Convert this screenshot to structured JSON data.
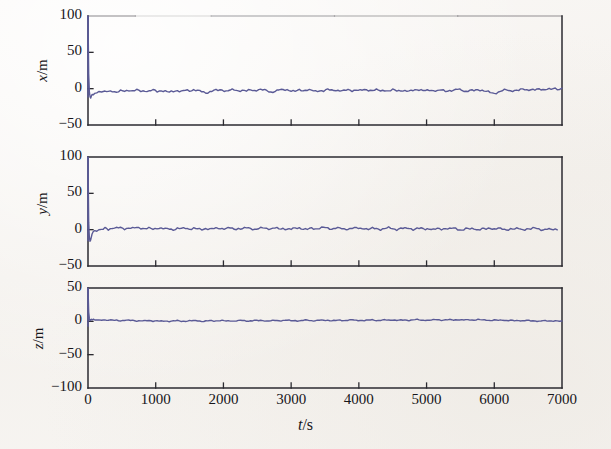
{
  "figure": {
    "background_color": "#f6f4f1",
    "axis_color": "#2b2a30",
    "trace_color": "#5a5a96",
    "xlabel": "t/s",
    "xlabel_var": "t",
    "xlabel_unit": "/s"
  },
  "chart_data": [
    {
      "type": "line",
      "title": "",
      "panel_id": "panel-x",
      "xlabel": "t/s",
      "ylabel": "x/m",
      "ylabel_var": "x",
      "ylabel_unit": "/m",
      "xlim": [
        0,
        7000
      ],
      "ylim": [
        -50,
        100
      ],
      "xticks": [
        0,
        1000,
        2000,
        3000,
        4000,
        5000,
        6000,
        7000
      ],
      "xtick_labels": [
        "0",
        "1000",
        "2000",
        "3000",
        "4000",
        "5000",
        "6000",
        "7000"
      ],
      "xtick_labels_visible": false,
      "yticks": [
        -50,
        0,
        50,
        100
      ],
      "ytick_labels": [
        "-50",
        "0",
        "50",
        "100"
      ],
      "grid": false,
      "legend": null,
      "series": [
        {
          "name": "x error",
          "color": "#5a5a96",
          "initial_transient": {
            "t": 0,
            "from": 100,
            "to": -12
          },
          "x": [
            0,
            10,
            20,
            30,
            40,
            50,
            60,
            80,
            100,
            130,
            160,
            200,
            250,
            300,
            360,
            420,
            480,
            540,
            600,
            660,
            720,
            780,
            840,
            900,
            960,
            1020,
            1080,
            1140,
            1200,
            1260,
            1320,
            1380,
            1440,
            1500,
            1560,
            1620,
            1680,
            1740,
            1800,
            1860,
            1920,
            1980,
            2040,
            2100,
            2160,
            2220,
            2280,
            2340,
            2400,
            2460,
            2520,
            2580,
            2640,
            2700,
            2760,
            2820,
            2880,
            2940,
            3000,
            3060,
            3120,
            3180,
            3240,
            3300,
            3360,
            3420,
            3480,
            3540,
            3600,
            3660,
            3720,
            3780,
            3840,
            3900,
            3960,
            4020,
            4080,
            4140,
            4200,
            4260,
            4320,
            4380,
            4440,
            4500,
            4560,
            4620,
            4680,
            4740,
            4800,
            4860,
            4920,
            4980,
            5040,
            5100,
            5160,
            5220,
            5280,
            5340,
            5400,
            5460,
            5520,
            5580,
            5640,
            5700,
            5760,
            5820,
            5880,
            5940,
            6000,
            6060,
            6120,
            6180,
            6240,
            6300,
            6360,
            6420,
            6480,
            6540,
            6600,
            6660,
            6720,
            6780,
            6840,
            6900,
            6960,
            7000
          ],
          "y": [
            100,
            20,
            -4,
            -11,
            -13,
            -10,
            -8,
            -9,
            -7,
            -6,
            -5,
            -4,
            -3.5,
            -4.2,
            -3.0,
            -4.6,
            -2.8,
            -3.6,
            -2.2,
            -3.4,
            -1.8,
            -3.0,
            -2.6,
            -4.0,
            -2.4,
            -3.8,
            -2.0,
            -3.2,
            -5.4,
            -4.0,
            -2.6,
            -3.4,
            -2.0,
            -3.0,
            -1.6,
            -2.8,
            -4.2,
            -5.6,
            -3.8,
            -2.4,
            -3.0,
            -1.8,
            -2.6,
            -1.4,
            -2.2,
            -3.6,
            -2.0,
            -3.0,
            -1.6,
            -2.6,
            -1.2,
            -2.0,
            -3.2,
            -4.4,
            -3.0,
            -1.8,
            -2.6,
            -1.4,
            -2.2,
            -3.4,
            -2.0,
            -2.8,
            -1.6,
            -2.4,
            -3.6,
            -2.2,
            -3.0,
            -1.8,
            -2.6,
            -1.4,
            -2.2,
            -3.2,
            -2.0,
            -2.8,
            -1.6,
            -2.4,
            -1.2,
            -2.0,
            -3.0,
            -1.8,
            -2.6,
            -1.4,
            -3.6,
            -2.2,
            -3.0,
            -1.8,
            -2.6,
            -4.0,
            -2.4,
            -1.2,
            -2.0,
            -2.8,
            -1.6,
            -2.4,
            -3.6,
            -2.2,
            -3.0,
            -1.8,
            -2.6,
            -1.4,
            -2.2,
            -3.4,
            -2.0,
            -2.8,
            -1.6,
            -2.4,
            -3.8,
            -5.0,
            -6.2,
            -4.6,
            -3.2,
            -2.0,
            -2.8,
            -1.6,
            -2.4,
            -1.2,
            -2.0,
            -0.8,
            -1.6,
            -0.6,
            -1.4,
            -0.4,
            -1.2,
            0.2,
            -0.6,
            0.8,
            0.4
          ]
        }
      ]
    },
    {
      "type": "line",
      "title": "",
      "panel_id": "panel-y",
      "xlabel": "t/s",
      "ylabel": "y/m",
      "ylabel_var": "y",
      "ylabel_unit": "/m",
      "xlim": [
        0,
        7000
      ],
      "ylim": [
        -50,
        100
      ],
      "xticks": [
        0,
        1000,
        2000,
        3000,
        4000,
        5000,
        6000,
        7000
      ],
      "xtick_labels": [
        "0",
        "1000",
        "2000",
        "3000",
        "4000",
        "5000",
        "6000",
        "7000"
      ],
      "xtick_labels_visible": false,
      "yticks": [
        -50,
        0,
        50,
        100
      ],
      "ytick_labels": [
        "-50",
        "0",
        "50",
        "100"
      ],
      "grid": false,
      "legend": null,
      "series": [
        {
          "name": "y error",
          "color": "#5a5a96",
          "initial_transient": {
            "t": 0,
            "from": 100,
            "to": -16
          },
          "x": [
            0,
            10,
            20,
            30,
            40,
            50,
            60,
            80,
            100,
            130,
            160,
            200,
            250,
            300,
            360,
            420,
            480,
            540,
            600,
            660,
            720,
            780,
            840,
            900,
            960,
            1020,
            1080,
            1140,
            1200,
            1260,
            1320,
            1380,
            1440,
            1500,
            1560,
            1620,
            1680,
            1740,
            1800,
            1860,
            1920,
            1980,
            2040,
            2100,
            2160,
            2220,
            2280,
            2340,
            2400,
            2460,
            2520,
            2580,
            2640,
            2700,
            2760,
            2820,
            2880,
            2940,
            3000,
            3060,
            3120,
            3180,
            3240,
            3300,
            3360,
            3420,
            3480,
            3540,
            3600,
            3660,
            3720,
            3780,
            3840,
            3900,
            3960,
            4020,
            4080,
            4140,
            4200,
            4260,
            4320,
            4380,
            4440,
            4500,
            4560,
            4620,
            4680,
            4740,
            4800,
            4860,
            4920,
            4980,
            5040,
            5100,
            5160,
            5220,
            5280,
            5340,
            5400,
            5460,
            5520,
            5580,
            5640,
            5700,
            5760,
            5820,
            5880,
            5940,
            6000,
            6060,
            6120,
            6180,
            6240,
            6300,
            6360,
            6420,
            6480,
            6540,
            6600,
            6660,
            6720,
            6780,
            6840,
            6900,
            6960,
            7000
          ],
          "y": [
            100,
            10,
            -10,
            -16,
            -14,
            -10,
            -6,
            -3,
            -1.5,
            -0.5,
            0.5,
            1.2,
            1.8,
            1.0,
            2.2,
            1.4,
            2.6,
            1.6,
            2.8,
            1.8,
            3.0,
            2.0,
            1.0,
            2.2,
            1.2,
            2.4,
            1.4,
            0.4,
            1.6,
            0.6,
            1.8,
            0.8,
            2.0,
            1.0,
            2.2,
            1.2,
            0.2,
            1.4,
            0.4,
            1.6,
            2.8,
            1.8,
            0.8,
            2.0,
            1.0,
            2.2,
            1.2,
            2.4,
            1.4,
            0.4,
            1.6,
            2.8,
            1.8,
            0.8,
            2.0,
            1.0,
            2.2,
            1.2,
            0.2,
            1.4,
            2.6,
            1.6,
            0.6,
            1.8,
            0.8,
            2.0,
            3.2,
            2.2,
            1.2,
            2.4,
            1.4,
            0.4,
            1.6,
            2.8,
            1.8,
            0.8,
            2.0,
            1.0,
            2.2,
            1.2,
            0.2,
            1.4,
            2.6,
            1.6,
            0.6,
            1.8,
            0.8,
            2.0,
            1.0,
            2.2,
            1.2,
            0.2,
            1.4,
            0.4,
            1.6,
            0.6,
            1.8,
            0.8,
            2.0,
            1.0,
            0.0,
            1.2,
            0.2,
            1.4,
            0.4,
            1.6,
            0.6,
            1.8,
            0.8,
            2.0,
            1.0,
            0.0,
            1.2,
            0.2,
            1.4,
            0.4,
            1.6,
            0.6,
            1.8,
            0.8,
            0.0,
            1.0,
            0.2,
            0.6,
            0.4
          ]
        }
      ]
    },
    {
      "type": "line",
      "title": "",
      "panel_id": "panel-z",
      "xlabel": "t/s",
      "ylabel": "z/m",
      "ylabel_var": "z",
      "ylabel_unit": "/m",
      "xlim": [
        0,
        7000
      ],
      "ylim": [
        -100,
        50
      ],
      "xticks": [
        0,
        1000,
        2000,
        3000,
        4000,
        5000,
        6000,
        7000
      ],
      "xtick_labels": [
        "0",
        "1000",
        "2000",
        "3000",
        "4000",
        "5000",
        "6000",
        "7000"
      ],
      "xtick_labels_visible": true,
      "yticks": [
        -100,
        -50,
        0,
        50
      ],
      "ytick_labels": [
        "-100",
        "-50",
        "0",
        "50"
      ],
      "grid": false,
      "legend": null,
      "series": [
        {
          "name": "z error",
          "color": "#5a5a96",
          "initial_transient": {
            "t": 0,
            "from": 50,
            "to": -8
          },
          "x": [
            0,
            10,
            20,
            30,
            40,
            50,
            60,
            80,
            100,
            130,
            160,
            200,
            250,
            300,
            360,
            420,
            480,
            540,
            600,
            660,
            720,
            780,
            840,
            900,
            960,
            1020,
            1080,
            1140,
            1200,
            1260,
            1320,
            1380,
            1440,
            1500,
            1560,
            1620,
            1680,
            1740,
            1800,
            1860,
            1920,
            1980,
            2040,
            2100,
            2160,
            2220,
            2280,
            2340,
            2400,
            2460,
            2520,
            2580,
            2640,
            2700,
            2760,
            2820,
            2880,
            2940,
            3000,
            3060,
            3120,
            3180,
            3240,
            3300,
            3360,
            3420,
            3480,
            3540,
            3600,
            3660,
            3720,
            3780,
            3840,
            3900,
            3960,
            4020,
            4080,
            4140,
            4200,
            4260,
            4320,
            4380,
            4440,
            4500,
            4560,
            4620,
            4680,
            4740,
            4800,
            4860,
            4920,
            4980,
            5040,
            5100,
            5160,
            5220,
            5280,
            5340,
            5400,
            5460,
            5520,
            5580,
            5640,
            5700,
            5760,
            5820,
            5880,
            5940,
            6000,
            6060,
            6120,
            6180,
            6240,
            6300,
            6360,
            6420,
            6480,
            6540,
            6600,
            6660,
            6720,
            6780,
            6840,
            6900,
            6960,
            7000
          ],
          "y": [
            50,
            14,
            4,
            1,
            2.5,
            3.0,
            2.0,
            2.6,
            2.0,
            2.4,
            1.8,
            2.2,
            1.6,
            2.0,
            1.4,
            1.8,
            1.2,
            1.6,
            1.0,
            1.4,
            0.8,
            1.2,
            0.6,
            1.0,
            0.4,
            0.8,
            0.2,
            0.6,
            0.0,
            0.4,
            0.8,
            0.2,
            0.6,
            1.0,
            0.4,
            0.8,
            0.2,
            0.6,
            1.0,
            0.4,
            0.8,
            1.2,
            0.6,
            1.0,
            0.4,
            0.8,
            1.2,
            0.6,
            1.0,
            1.4,
            0.8,
            1.2,
            0.6,
            1.0,
            1.4,
            0.8,
            1.2,
            1.6,
            1.0,
            1.4,
            0.8,
            1.2,
            1.6,
            1.0,
            1.4,
            1.8,
            1.2,
            1.6,
            1.0,
            1.4,
            1.8,
            1.2,
            1.6,
            2.0,
            1.4,
            1.8,
            1.2,
            1.6,
            2.0,
            1.4,
            1.8,
            2.2,
            1.6,
            2.0,
            1.4,
            1.8,
            2.2,
            1.6,
            2.0,
            2.4,
            1.8,
            2.2,
            1.6,
            2.0,
            2.4,
            1.8,
            2.2,
            2.6,
            2.0,
            2.4,
            1.8,
            2.2,
            2.6,
            2.0,
            2.4,
            1.8,
            2.2,
            1.6,
            2.0,
            1.4,
            1.8,
            1.2,
            1.6,
            1.0,
            1.4,
            0.8,
            1.2,
            0.6,
            1.0,
            0.4,
            0.8,
            0.2,
            0.6,
            1.0,
            0.4,
            0.6
          ]
        }
      ]
    }
  ]
}
